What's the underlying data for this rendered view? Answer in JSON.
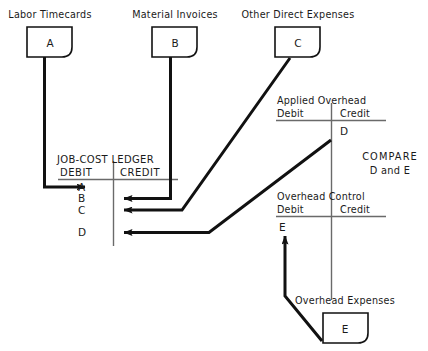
{
  "diagram": {
    "colors": {
      "ink": "#1a1a1a",
      "line": "#111111",
      "background": "#ffffff",
      "rule": "#555555"
    },
    "source_documents": [
      {
        "id": "doc-a",
        "caption": "Labor Timecards",
        "letter": "A"
      },
      {
        "id": "doc-b",
        "caption": "Material Invoices",
        "letter": "B"
      },
      {
        "id": "doc-c",
        "caption": "Other Direct Expenses",
        "letter": "C"
      },
      {
        "id": "doc-e",
        "caption": "Overhead Expenses",
        "letter": "E"
      }
    ],
    "ledger": {
      "title": "JOB-COST LEDGER",
      "debit_header": "DEBIT",
      "credit_header": "CREDIT",
      "debit_entries": [
        "A",
        "B",
        "C",
        "D"
      ],
      "credit_entries": []
    },
    "applied_overhead": {
      "title": "Applied Overhead",
      "debit_header": "Debit",
      "credit_header": "Credit",
      "debit_entries": [],
      "credit_entries": [
        "D"
      ]
    },
    "overhead_control": {
      "title": "Overhead Control",
      "debit_header": "Debit",
      "credit_header": "Credit",
      "debit_entries": [
        "E"
      ],
      "credit_entries": []
    },
    "compare_note": {
      "line1": "COMPARE",
      "line2": "D and E"
    }
  }
}
